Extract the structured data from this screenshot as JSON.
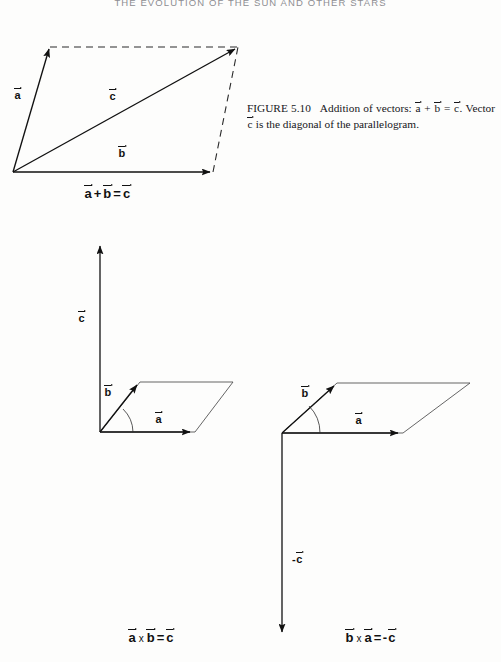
{
  "page": {
    "running_head": "THE EVOLUTION OF THE SUN AND OTHER STARS",
    "width": 501,
    "height": 662,
    "ink_color": "#111111",
    "paper_color": "#fdfdfc"
  },
  "caption": {
    "figure_number": "FIGURE 5.10",
    "text_part1": "Addition of vectors: ",
    "a": "a",
    "plus": " + ",
    "b": "b",
    "equals": " = ",
    "c": "c",
    "text_part2": ". Vector ",
    "c2": "c",
    "text_part3": " is the diagonal of the parallelogram."
  },
  "figures": [
    {
      "id": "vector-addition",
      "title": "Addition of vectors parallelogram",
      "labels": {
        "a": "a",
        "b": "b",
        "c": "c"
      },
      "equation": {
        "a": "a",
        "plus": "+",
        "b": "b",
        "equals": "=",
        "c": "c"
      },
      "geometry": {
        "origin": [
          13,
          172
        ],
        "a_tip": [
          50,
          47
        ],
        "b_tip": [
          213,
          172
        ],
        "c_tip": [
          238,
          47
        ],
        "solid_vectors": [
          "a",
          "b",
          "c"
        ],
        "dashed_sides": [
          "a_tip-to-c_tip",
          "b_tip-to-c_tip"
        ]
      }
    },
    {
      "id": "cross-product-a-cross-b",
      "title": "Right-hand rule: a cross b equals c",
      "labels": {
        "a": "a",
        "b": "b",
        "c": "c"
      },
      "equation": {
        "left1": "a",
        "cross": "x",
        "left2": "b",
        "equals": "=",
        "right": "c"
      },
      "geometry": {
        "origin": [
          100,
          432
        ],
        "a_tip": [
          195,
          432
        ],
        "b_tip": [
          140,
          382
        ],
        "far_corner": [
          233,
          382
        ],
        "c_tip": [
          100,
          243
        ],
        "c_direction": "up",
        "angle_arc": true
      }
    },
    {
      "id": "cross-product-b-cross-a",
      "title": "Right-hand rule: b cross a equals negative c",
      "labels": {
        "a": "a",
        "b": "b",
        "c": "-c",
        "c_sign": "-",
        "c_letter": "c"
      },
      "equation": {
        "left1": "b",
        "cross": "x",
        "left2": "a",
        "equals": "=",
        "minus": "-",
        "right": "c"
      },
      "geometry": {
        "origin": [
          282,
          433
        ],
        "a_tip": [
          403,
          433
        ],
        "b_tip": [
          337,
          383
        ],
        "far_corner": [
          470,
          383
        ],
        "c_tip": [
          282,
          637
        ],
        "c_direction": "down",
        "angle_arc": true
      }
    }
  ]
}
